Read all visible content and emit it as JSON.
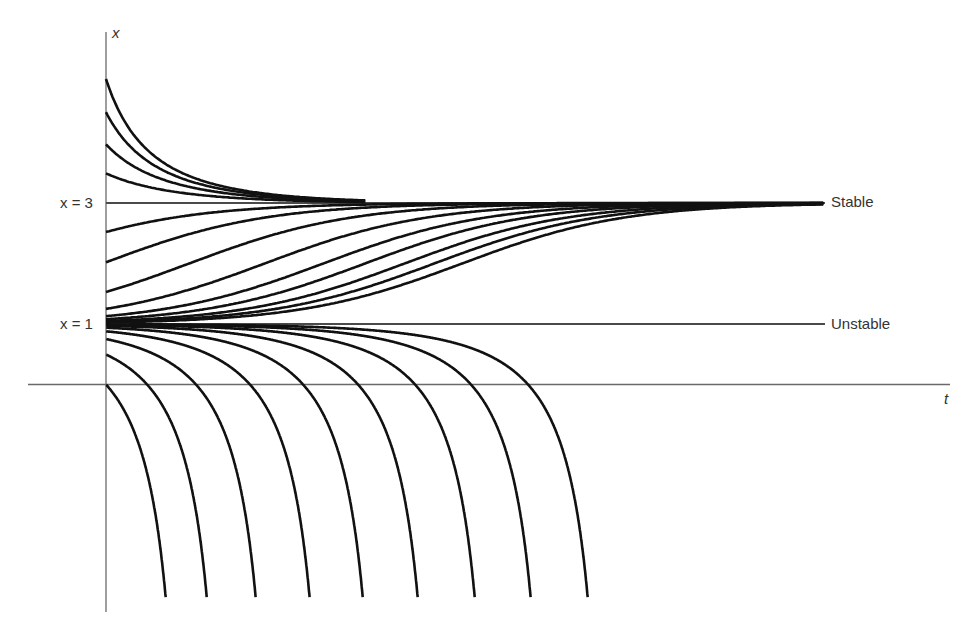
{
  "chart_data": {
    "type": "line",
    "title": "",
    "xlabel": "t",
    "ylabel": "x",
    "equilibria": [
      {
        "value": 3,
        "label": "x = 3",
        "stability": "Stable"
      },
      {
        "value": 1,
        "label": "x = 1",
        "stability": "Unstable"
      }
    ],
    "curves_above_3": {
      "x0": [
        5.05,
        4.5,
        3.97,
        3.49
      ],
      "t_end": 1.6
    },
    "curves_between_1_and_3": {
      "x0": [
        2.52,
        2.02,
        1.53,
        1.25,
        1.13,
        1.08,
        1.05,
        1.035,
        1.025
      ],
      "t_end": 4.4
    },
    "curves_below_1": {
      "blowup_shift_t": [
        0,
        0.252,
        0.552,
        0.883,
        1.209,
        1.546,
        1.896,
        2.239,
        2.589
      ],
      "x_end": -3.57
    }
  },
  "labels": {
    "y_axis": "x",
    "x_axis": "t",
    "eq3": "x = 3",
    "eq1": "x = 1",
    "stable": "Stable",
    "unstable": "Unstable"
  },
  "colors": {
    "curve": "#111111",
    "axis": "#6a6a6a",
    "text": "#333333"
  }
}
